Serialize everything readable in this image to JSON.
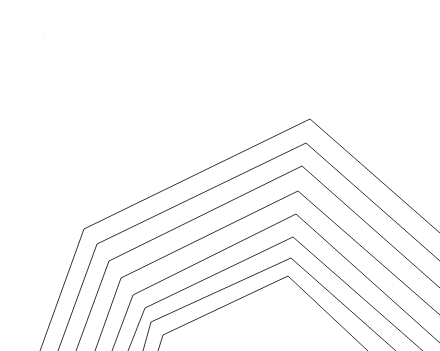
{
  "image": {
    "width": 440,
    "height": 351,
    "background": "#ffffff",
    "stroke_color": "#333333",
    "stroke_width": 1
  },
  "nested_polylines": [
    {
      "name": "line-1",
      "points": "40,351 84,229 310,119 440,233"
    },
    {
      "name": "line-2",
      "points": "58,351 97,244 306,143 440,261"
    },
    {
      "name": "line-3",
      "points": "76,351 109,261 302,166 440,288"
    },
    {
      "name": "line-4",
      "points": "95,351 121,278 298,191 440,315"
    },
    {
      "name": "line-5",
      "points": "112,351 133,295 296,214 440,343"
    },
    {
      "name": "line-6",
      "points": "128,351 145,308 293,237 423,351"
    },
    {
      "name": "line-7",
      "points": "143,351 151,322 291,258 396,351"
    },
    {
      "name": "line-8",
      "points": "158,351 163,335 288,276 368,351"
    }
  ]
}
